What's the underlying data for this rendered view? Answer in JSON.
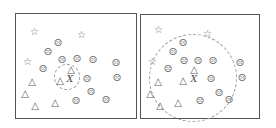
{
  "figure": {
    "panels": [
      {
        "name": "left-panel",
        "box": {
          "x": 15,
          "y": 13,
          "w": 122,
          "h": 106
        },
        "query_label": "X",
        "query_pos": [
          70,
          79
        ],
        "neighborhood_circle": {
          "cx": 67,
          "cy": 77,
          "r": 13
        },
        "stars": [
          [
            34,
            32
          ],
          [
            81,
            35
          ],
          [
            27,
            62
          ]
        ],
        "faces": [
          [
            58,
            43
          ],
          [
            48,
            52
          ],
          [
            62,
            60
          ],
          [
            77,
            59
          ],
          [
            93,
            60
          ],
          [
            116,
            63
          ],
          [
            43,
            69
          ],
          [
            87,
            79
          ],
          [
            117,
            78
          ],
          [
            91,
            92
          ],
          [
            76,
            101
          ],
          [
            106,
            100
          ]
        ],
        "triangles": [
          [
            71,
            70
          ],
          [
            60,
            81
          ],
          [
            32,
            82
          ],
          [
            25,
            94
          ],
          [
            35,
            106
          ],
          [
            55,
            103
          ]
        ]
      },
      {
        "name": "right-panel",
        "box": {
          "x": 140,
          "y": 14,
          "w": 120,
          "h": 105
        },
        "query_label": "X",
        "query_pos": [
          194,
          79
        ],
        "neighborhood_circle": {
          "cx": 193,
          "cy": 78,
          "r": 44
        },
        "stars": [
          [
            158,
            30
          ],
          [
            207,
            34
          ],
          [
            152,
            62
          ]
        ],
        "faces": [
          [
            183,
            43
          ],
          [
            173,
            52
          ],
          [
            184,
            61
          ],
          [
            198,
            61
          ],
          [
            213,
            61
          ],
          [
            240,
            63
          ],
          [
            168,
            69
          ],
          [
            211,
            79
          ],
          [
            242,
            78
          ],
          [
            219,
            93
          ],
          [
            200,
            101
          ],
          [
            229,
            100
          ]
        ],
        "triangles": [
          [
            194,
            70
          ],
          [
            183,
            81
          ],
          [
            158,
            82
          ],
          [
            150,
            94
          ],
          [
            160,
            106
          ],
          [
            178,
            103
          ]
        ]
      }
    ],
    "glyphs": {
      "star": "☆",
      "face": "☹",
      "triangle": "△"
    },
    "colors": {
      "border": "#555555",
      "marker": "#666666",
      "dashed": "#999999"
    }
  }
}
